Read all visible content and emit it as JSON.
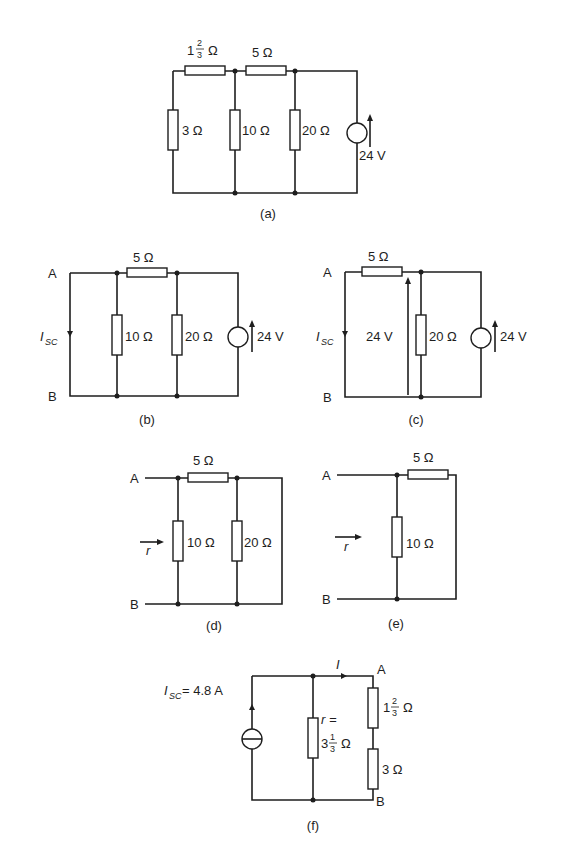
{
  "diagrams": {
    "a": {
      "caption": "(a)",
      "r_top_left": {
        "whole": "1",
        "num": "2",
        "den": "3",
        "unit": "Ω"
      },
      "r_top_mid": "5 Ω",
      "r_left": "3 Ω",
      "r_mid": "10 Ω",
      "r_right": "20 Ω",
      "source": "24 V"
    },
    "b": {
      "caption": "(b)",
      "node_a": "A",
      "node_b": "B",
      "current": "I",
      "current_sub": "SC",
      "r_top": "5 Ω",
      "r_mid": "10 Ω",
      "r_right": "20 Ω",
      "source": "24 V"
    },
    "c": {
      "caption": "(c)",
      "node_a": "A",
      "node_b": "B",
      "current": "I",
      "current_sub": "SC",
      "r_top": "5 Ω",
      "voltage_arrow": "24 V",
      "r_mid": "20 Ω",
      "source": "24 V"
    },
    "d": {
      "caption": "(d)",
      "node_a": "A",
      "node_b": "B",
      "r_symbol": "r",
      "r_top": "5 Ω",
      "r_mid": "10 Ω",
      "r_right": "20 Ω"
    },
    "e": {
      "caption": "(e)",
      "node_a": "A",
      "node_b": "B",
      "r_symbol": "r",
      "r_top": "5 Ω",
      "r_mid": "10 Ω"
    },
    "f": {
      "caption": "(f)",
      "source_label": "I",
      "source_sub": "SC",
      "source_value": "= 4.8 A",
      "current": "I",
      "node_a": "A",
      "node_b": "B",
      "r_label": "r =",
      "r_value": {
        "whole": "3",
        "num": "1",
        "den": "3",
        "unit": "Ω"
      },
      "r_top": {
        "whole": "1",
        "num": "2",
        "den": "3",
        "unit": "Ω"
      },
      "r_bottom": "3 Ω"
    }
  }
}
